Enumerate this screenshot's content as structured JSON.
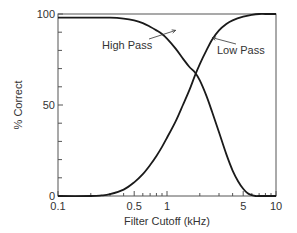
{
  "chart_data": {
    "type": "line",
    "title": "",
    "xlabel": "Filter Cutoff (kHz)",
    "ylabel": "% Correct",
    "xscale": "log",
    "xlim": [
      0.1,
      10
    ],
    "ylim": [
      0,
      100
    ],
    "grid": false,
    "legend": "none (inline annotations)",
    "x_ticks": [
      {
        "value": 0.1,
        "label": "0.1"
      },
      {
        "value": 0.5,
        "label": "0.5"
      },
      {
        "value": 1,
        "label": "1"
      },
      {
        "value": 5,
        "label": "5"
      },
      {
        "value": 10,
        "label": "10"
      }
    ],
    "x_minor_ticks": [
      0.2,
      0.3,
      0.4,
      0.6,
      0.7,
      0.8,
      0.9,
      2,
      3,
      4,
      6,
      7,
      8,
      9
    ],
    "y_ticks": [
      {
        "value": 0,
        "label": "0"
      },
      {
        "value": 50,
        "label": "50"
      },
      {
        "value": 100,
        "label": "100"
      }
    ],
    "y_minor_ticks": [
      10,
      20,
      30,
      40,
      60,
      70,
      80,
      90
    ],
    "series": [
      {
        "name": "High Pass",
        "x": [
          0.1,
          0.2,
          0.3,
          0.4,
          0.5,
          0.6,
          0.7,
          0.8,
          0.9,
          1.0,
          1.2,
          1.4,
          1.6,
          1.8,
          2.0,
          2.3,
          2.6,
          3.0,
          3.5,
          4.0,
          4.5,
          5.0,
          5.5,
          6.0,
          6.5,
          7.0,
          10.0
        ],
        "values": [
          98,
          98,
          98,
          97.5,
          96.5,
          95,
          93,
          91,
          89,
          86.5,
          81,
          75.5,
          71,
          68,
          63.5,
          55,
          46,
          35,
          23,
          14,
          8,
          4,
          1.5,
          0.5,
          0,
          0,
          0
        ]
      },
      {
        "name": "Low Pass",
        "x": [
          0.1,
          0.2,
          0.25,
          0.3,
          0.4,
          0.5,
          0.6,
          0.7,
          0.8,
          0.9,
          1.0,
          1.2,
          1.4,
          1.6,
          1.8,
          2.0,
          2.3,
          2.6,
          3.0,
          3.5,
          4.0,
          5.0,
          6.0,
          7.0,
          8.0,
          10.0
        ],
        "values": [
          0,
          0,
          0.3,
          1,
          3.5,
          7.5,
          12,
          17,
          22,
          27,
          32,
          41,
          50,
          58,
          66,
          72.5,
          80,
          86,
          91,
          94.5,
          96.5,
          98.5,
          99.5,
          100,
          100,
          100
        ]
      }
    ],
    "annotations": [
      {
        "text": "High Pass",
        "target_series": "High Pass",
        "arrow_to": {
          "x": 1.2,
          "y": 91
        }
      },
      {
        "text": "Low Pass",
        "target_series": "Low Pass",
        "arrow_to": {
          "x": 2.6,
          "y": 87
        }
      }
    ],
    "crossover": {
      "x": 1.85,
      "y": 67
    }
  }
}
